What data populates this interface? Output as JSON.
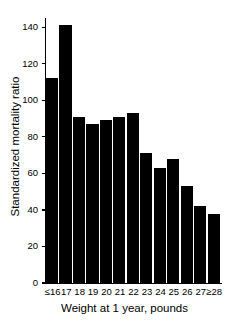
{
  "chart_data": {
    "type": "bar",
    "title": "",
    "xlabel": "Weight at 1 year, pounds",
    "ylabel": "Standardized mortality ratio",
    "categories": [
      "≤16",
      "17",
      "18",
      "19",
      "20",
      "21",
      "22",
      "23",
      "24",
      "25",
      "26",
      "27",
      "≥28"
    ],
    "values": [
      112,
      141,
      91,
      87,
      89,
      91,
      93,
      71,
      63,
      68,
      53,
      42,
      38
    ],
    "ylim": [
      0,
      145
    ],
    "xlim_note": "categorical, 13 contiguous bars",
    "yticks": [
      0,
      20,
      40,
      60,
      80,
      100,
      120,
      140
    ],
    "ytick_labels": [
      "0",
      "20",
      "40",
      "60",
      "80",
      "100",
      "120",
      "140"
    ],
    "grid": false,
    "legend": null,
    "bar_color": "#000000",
    "background_color": "#ffffff",
    "axis_color": "#000000"
  },
  "figure": {
    "axis_label_font_size_px": 11.5,
    "tick_label_font_size_px": 9.5
  }
}
